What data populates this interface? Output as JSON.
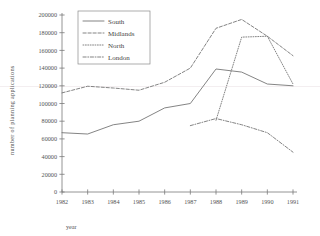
{
  "chart_data": {
    "type": "line",
    "title": "",
    "xlabel": "year",
    "ylabel": "number of  planning applications",
    "categories": [
      "1982",
      "1983",
      "1984",
      "1985",
      "1986",
      "1987",
      "1988",
      "1989",
      "1990",
      "1991"
    ],
    "x": [
      1982,
      1983,
      1984,
      1985,
      1986,
      1987,
      1988,
      1989,
      1990,
      1991
    ],
    "xlim": [
      1982,
      1991
    ],
    "ylim": [
      0,
      200000
    ],
    "ytick_values": [
      0,
      20000,
      40000,
      60000,
      80000,
      100000,
      120000,
      140000,
      160000,
      180000,
      200000
    ],
    "ytick_labels": [
      "0",
      "20000",
      "40000",
      "60000",
      "80000",
      "100000",
      "120000",
      "140000",
      "160000",
      "180000",
      "200000"
    ],
    "grid": false,
    "legend_position": "top-left-inside",
    "series": [
      {
        "name": "South",
        "style": "solid",
        "x": [
          1982,
          1983,
          1984,
          1985,
          1986,
          1987,
          1988,
          1989,
          1990,
          1991
        ],
        "values": [
          67000,
          65500,
          76000,
          80000,
          95000,
          100000,
          139000,
          135500,
          122000,
          120000
        ]
      },
      {
        "name": "Midlands",
        "style": "dashed",
        "x": [
          1982,
          1983,
          1984,
          1985,
          1986,
          1987,
          1988,
          1989,
          1990,
          1991
        ],
        "values": [
          112000,
          119500,
          117500,
          115000,
          124000,
          140000,
          185000,
          195000,
          176000,
          154000
        ]
      },
      {
        "name": "North",
        "style": "dotted",
        "x": [
          1988,
          1989,
          1990,
          1991
        ],
        "values": [
          81000,
          175000,
          176000,
          122000
        ]
      },
      {
        "name": "London",
        "style": "dashdot",
        "x": [
          1987,
          1988,
          1989,
          1990,
          1991
        ],
        "values": [
          75000,
          83000,
          76000,
          67000,
          45000
        ]
      }
    ]
  },
  "legend": {
    "entries": [
      {
        "label": "South",
        "style": "solid"
      },
      {
        "label": "Midlands",
        "style": "dashed"
      },
      {
        "label": "North",
        "style": "dotted"
      },
      {
        "label": "London",
        "style": "dashdot"
      }
    ]
  },
  "axes": {
    "x_title": "year",
    "y_title": "number of  planning applications"
  },
  "colors": {
    "line": "#6e6e6e",
    "axis": "#7a7a7a",
    "text": "#555555",
    "background": "#ffffff"
  }
}
